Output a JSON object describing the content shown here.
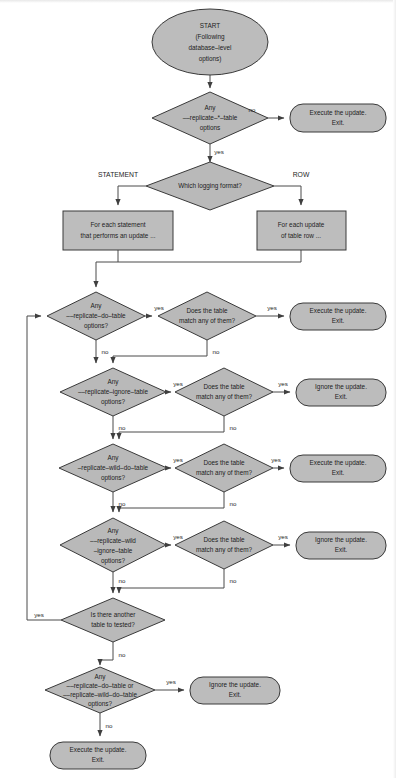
{
  "diagram": {
    "colors": {
      "shape_fill": "#b9b9b9",
      "shape_stroke": "#3a3a3a",
      "connector": "#4a4a4a",
      "background": "#ffffff",
      "text": "#1d1d1d"
    },
    "nodes": [
      {
        "id": "start",
        "type": "terminator-oval",
        "lines": [
          "START",
          "(Following",
          "database–level",
          "options)"
        ],
        "cx": 210,
        "cy": 42,
        "rx": 58,
        "ry": 33
      },
      {
        "id": "d-any-replicate-star-table",
        "type": "decision-diamond",
        "lines": [
          "Any",
          "––replicate–*–table",
          "options"
        ],
        "cx": 210,
        "cy": 118,
        "rx": 58,
        "ry": 26
      },
      {
        "id": "t-exec-1",
        "type": "terminator-rounded",
        "lines": [
          "Execute the update.",
          "Exit."
        ],
        "x": 290,
        "y": 104,
        "w": 96,
        "h": 28
      },
      {
        "id": "d-which-logging-format",
        "type": "decision-diamond",
        "lines": [
          "Which logging format?"
        ],
        "cx": 210,
        "cy": 186,
        "rx": 64,
        "ry": 24
      },
      {
        "id": "p-for-each-statement",
        "type": "process-rect",
        "lines": [
          "For each statement",
          "that performs an update ..."
        ],
        "x": 63,
        "y": 211,
        "w": 110,
        "h": 39
      },
      {
        "id": "p-for-each-update-row",
        "type": "process-rect",
        "lines": [
          "For each update",
          "of table row ..."
        ],
        "x": 257,
        "y": 211,
        "w": 89,
        "h": 39
      },
      {
        "id": "d-replicate-do-table",
        "type": "decision-diamond",
        "lines": [
          "Any",
          "––replicate–do–table",
          "options?"
        ],
        "cx": 96,
        "cy": 316,
        "rx": 49,
        "ry": 24
      },
      {
        "id": "d-match-1",
        "type": "decision-diamond",
        "lines": [
          "Does the table",
          "match any of them?"
        ],
        "cx": 207,
        "cy": 316,
        "rx": 49,
        "ry": 24
      },
      {
        "id": "t-exec-2",
        "type": "terminator-rounded",
        "lines": [
          "Execute the update.",
          "Exit."
        ],
        "x": 290,
        "y": 303,
        "w": 96,
        "h": 27
      },
      {
        "id": "d-replicate-ignore-table",
        "type": "decision-diamond",
        "lines": [
          "Any",
          "––replicate–ignore–table",
          "options?"
        ],
        "cx": 113,
        "cy": 392,
        "rx": 53,
        "ry": 24
      },
      {
        "id": "d-match-2",
        "type": "decision-diamond",
        "lines": [
          "Does the table",
          "match any of them?"
        ],
        "cx": 224,
        "cy": 392,
        "rx": 49,
        "ry": 24
      },
      {
        "id": "t-ignore-1",
        "type": "terminator-rounded",
        "lines": [
          "Ignore the update.",
          "Exit."
        ],
        "x": 296,
        "y": 379,
        "w": 90,
        "h": 27
      },
      {
        "id": "d-replicate-wild-do-table",
        "type": "decision-diamond",
        "lines": [
          "Any",
          "–replicate–wild–do–table",
          "options?"
        ],
        "cx": 113,
        "cy": 468,
        "rx": 54,
        "ry": 24
      },
      {
        "id": "d-match-3",
        "type": "decision-diamond",
        "lines": [
          "Does the table",
          "match any of them?"
        ],
        "cx": 224,
        "cy": 468,
        "rx": 49,
        "ry": 24
      },
      {
        "id": "t-exec-3",
        "type": "terminator-rounded",
        "lines": [
          "Execute the update.",
          "Exit."
        ],
        "x": 290,
        "y": 455,
        "w": 96,
        "h": 27
      },
      {
        "id": "d-replicate-wild-ignore-table",
        "type": "decision-diamond",
        "lines": [
          "Any",
          "––replicate–wild",
          "–ignore–table",
          "options?"
        ],
        "cx": 113,
        "cy": 545,
        "rx": 53,
        "ry": 27
      },
      {
        "id": "d-match-4",
        "type": "decision-diamond",
        "lines": [
          "Does the table",
          "match any of them?"
        ],
        "cx": 224,
        "cy": 545,
        "rx": 49,
        "ry": 24
      },
      {
        "id": "t-ignore-2",
        "type": "terminator-rounded",
        "lines": [
          "Ignore the update.",
          "Exit."
        ],
        "x": 296,
        "y": 532,
        "w": 90,
        "h": 27
      },
      {
        "id": "d-another-table",
        "type": "decision-diamond",
        "lines": [
          "Is there another",
          "table to tested?"
        ],
        "cx": 113,
        "cy": 620,
        "rx": 52,
        "ry": 22
      },
      {
        "id": "d-any-do-or-wild-do",
        "type": "decision-diamond",
        "lines": [
          "Any",
          "––replicate–do–table or",
          "––replicate–wild–do–table",
          "options?"
        ],
        "cx": 100,
        "cy": 690,
        "rx": 55,
        "ry": 23
      },
      {
        "id": "t-ignore-3",
        "type": "terminator-rounded",
        "lines": [
          "Ignore the update.",
          "Exit."
        ],
        "x": 190,
        "y": 677,
        "w": 90,
        "h": 27
      },
      {
        "id": "t-exec-4",
        "type": "terminator-rounded",
        "lines": [
          "Execute the update.",
          "Exit."
        ],
        "x": 50,
        "y": 742,
        "w": 96,
        "h": 27
      }
    ],
    "edge_labels": [
      {
        "id": "e-no-1",
        "text": "no",
        "x": 252,
        "y": 110
      },
      {
        "id": "e-yes-1",
        "text": "yes",
        "x": 219,
        "y": 152
      },
      {
        "id": "e-statement",
        "text": "STATEMENT",
        "x": 118,
        "y": 175
      },
      {
        "id": "e-row",
        "text": "ROW",
        "x": 301,
        "y": 175
      },
      {
        "id": "e-yes-2",
        "text": "yes",
        "x": 159,
        "y": 308
      },
      {
        "id": "e-yes-3",
        "text": "yes",
        "x": 272,
        "y": 308
      },
      {
        "id": "e-no-2",
        "text": "no",
        "x": 105,
        "y": 352
      },
      {
        "id": "e-no-3",
        "text": "no",
        "x": 216,
        "y": 352
      },
      {
        "id": "e-yes-4",
        "text": "yes",
        "x": 178,
        "y": 384
      },
      {
        "id": "e-yes-5",
        "text": "yes",
        "x": 283,
        "y": 384
      },
      {
        "id": "e-no-4",
        "text": "no",
        "x": 122,
        "y": 428
      },
      {
        "id": "e-no-5",
        "text": "no",
        "x": 233,
        "y": 428
      },
      {
        "id": "e-yes-6",
        "text": "yes",
        "x": 178,
        "y": 460
      },
      {
        "id": "e-yes-7",
        "text": "yes",
        "x": 276,
        "y": 460
      },
      {
        "id": "e-no-6",
        "text": "no",
        "x": 122,
        "y": 504
      },
      {
        "id": "e-no-7",
        "text": "no",
        "x": 233,
        "y": 504
      },
      {
        "id": "e-yes-8",
        "text": "yes",
        "x": 178,
        "y": 537
      },
      {
        "id": "e-yes-9",
        "text": "yes",
        "x": 283,
        "y": 537
      },
      {
        "id": "e-no-8",
        "text": "no",
        "x": 122,
        "y": 581
      },
      {
        "id": "e-no-9",
        "text": "no",
        "x": 233,
        "y": 581
      },
      {
        "id": "e-yes-loop",
        "text": "yes",
        "x": 39,
        "y": 615
      },
      {
        "id": "e-no-9b",
        "text": "no",
        "x": 122,
        "y": 655
      },
      {
        "id": "e-yes-10",
        "text": "yes",
        "x": 171,
        "y": 682
      },
      {
        "id": "e-no-10",
        "text": "no",
        "x": 109,
        "y": 726
      }
    ]
  }
}
